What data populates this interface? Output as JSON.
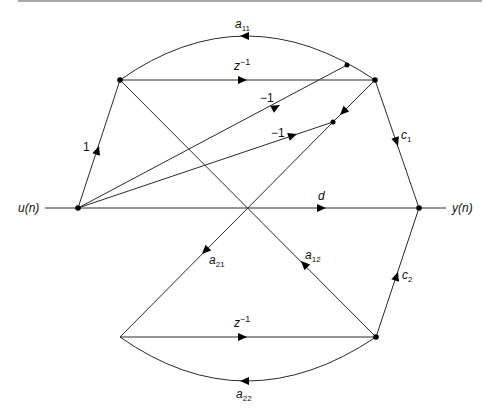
{
  "figure": {
    "type": "signal-flow-graph",
    "input_label": "u(n)",
    "output_label": "y(n)",
    "nodes": [
      {
        "id": "u",
        "role": "input"
      },
      {
        "id": "x1_in",
        "role": "state-1 delay input"
      },
      {
        "id": "x1_out",
        "role": "state-1 delay output"
      },
      {
        "id": "s1",
        "role": "summing node"
      },
      {
        "id": "s2",
        "role": "summing node"
      },
      {
        "id": "x2_in",
        "role": "state-2 delay input"
      },
      {
        "id": "x2_out",
        "role": "state-2 delay output"
      },
      {
        "id": "y",
        "role": "output"
      }
    ],
    "edges": [
      {
        "id": "e_in",
        "from": "input",
        "to": "u",
        "label": ""
      },
      {
        "id": "e_u_x1",
        "from": "u",
        "to": "x1_in",
        "label": "1"
      },
      {
        "id": "e_z1",
        "from": "x1_in",
        "to": "x1_out",
        "label": "z",
        "sup": "−1"
      },
      {
        "id": "e_a11",
        "from": "x1_out",
        "to": "x1_in",
        "label": "a",
        "sub": "11"
      },
      {
        "id": "e_m1a",
        "from": "u",
        "to": "s1",
        "label": "−1"
      },
      {
        "id": "e_m1b",
        "from": "u",
        "to": "s2",
        "label": "−1"
      },
      {
        "id": "e_x1_s2",
        "from": "x1_out",
        "to": "s2",
        "label": ""
      },
      {
        "id": "e_c1",
        "from": "x1_out",
        "to": "y",
        "label": "c",
        "sub": "1"
      },
      {
        "id": "e_d",
        "from": "u",
        "to": "y",
        "label": "d"
      },
      {
        "id": "e_a21",
        "from": "s2",
        "to": "x2_in",
        "label": "a",
        "sub": "21"
      },
      {
        "id": "e_a12",
        "from": "x2_out",
        "to": "x1_in",
        "label": "a",
        "sub": "12"
      },
      {
        "id": "e_z2",
        "from": "x2_in",
        "to": "x2_out",
        "label": "z",
        "sup": "−1"
      },
      {
        "id": "e_a22",
        "from": "x2_out",
        "to": "x2_in",
        "label": "a",
        "sub": "22"
      },
      {
        "id": "e_c2",
        "from": "x2_out",
        "to": "y",
        "label": "c",
        "sub": "2"
      },
      {
        "id": "e_out",
        "from": "y",
        "to": "output",
        "label": ""
      }
    ],
    "labels": {
      "u": "u(n)",
      "y": "y(n)",
      "one": "1",
      "neg1_upper": "−1",
      "neg1_lower": "−1",
      "z_top": "z",
      "z_top_sup": "−1",
      "z_bot": "z",
      "z_bot_sup": "−1",
      "a11": "a",
      "a11_sub": "11",
      "a22": "a",
      "a22_sub": "22",
      "a21": "a",
      "a21_sub": "21",
      "a12": "a",
      "a12_sub": "12",
      "c1": "c",
      "c1_sub": "1",
      "c2": "c",
      "c2_sub": "2",
      "d": "d"
    }
  }
}
